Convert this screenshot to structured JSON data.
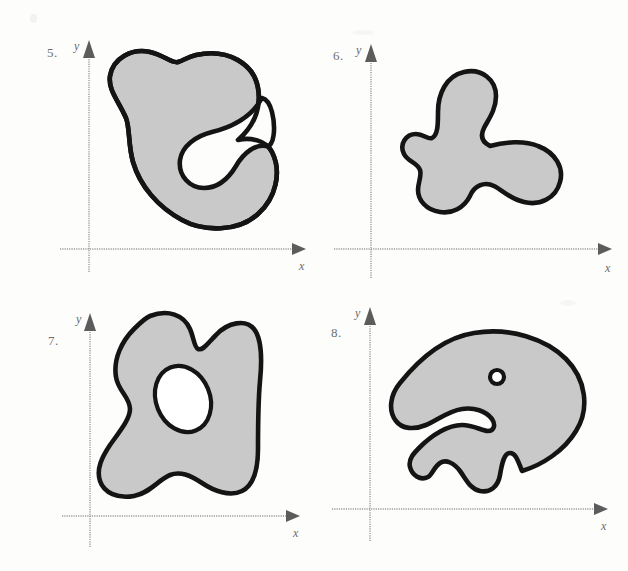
{
  "page": {
    "background_color": "#fdfdfc",
    "width": 628,
    "height": 571
  },
  "style": {
    "region_fill_color": "#c9c9c9",
    "region_outline_color": "#141414",
    "axis_color": "#9a9a9a",
    "axis_arrow_color": "#5c5c5c",
    "label_color": "#6f6f6f",
    "hole_fill_color": "#ffffff"
  },
  "panels": [
    {
      "id": "figure-5",
      "number_label": "5.",
      "x_axis_label": "x",
      "y_axis_label": "y",
      "description": "C-shaped shaded region with deep concave notch opening to the right",
      "holes": 0,
      "quadrant": "top-left"
    },
    {
      "id": "figure-6",
      "number_label": "6.",
      "x_axis_label": "x",
      "y_axis_label": "y",
      "description": "Three-lobed propeller shaped shaded region",
      "holes": 0,
      "quadrant": "top-right"
    },
    {
      "id": "figure-7",
      "number_label": "7.",
      "x_axis_label": "x",
      "y_axis_label": "y",
      "description": "Tall blob with two top bumps and an elliptical hole in the middle",
      "holes": 1,
      "quadrant": "bottom-left"
    },
    {
      "id": "figure-8",
      "number_label": "8.",
      "x_axis_label": "x",
      "y_axis_label": "y",
      "description": "Whale-head shaped blob with small round hole and a mouth notch",
      "holes": 1,
      "quadrant": "bottom-right"
    }
  ]
}
